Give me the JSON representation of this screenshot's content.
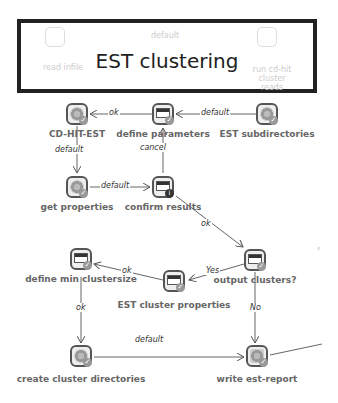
{
  "banner": {
    "title": "EST clustering",
    "ghost_nodes": [
      "read infile",
      "run cd-hit cluster reads"
    ],
    "ghost_edge": "default"
  },
  "nodes": [
    {
      "id": "cdhit",
      "label": "CD-HIT-EST",
      "icon": "gear-icon",
      "x": 66,
      "y": 102
    },
    {
      "id": "defparams",
      "label": "define parameters",
      "icon": "window-icon",
      "x": 152,
      "y": 102
    },
    {
      "id": "estsub",
      "label": "EST subdirectories",
      "icon": "gear-icon",
      "x": 256,
      "y": 102
    },
    {
      "id": "getprops",
      "label": "get properties",
      "icon": "gear-icon",
      "x": 66,
      "y": 175
    },
    {
      "id": "confirm",
      "label": "confirm results",
      "icon": "window-info-icon",
      "x": 152,
      "y": 175
    },
    {
      "id": "outclust",
      "label": "output clusters?",
      "icon": "window-icon",
      "x": 244,
      "y": 248
    },
    {
      "id": "defmin",
      "label": "define min clustersize",
      "icon": "window-icon",
      "x": 70,
      "y": 253
    },
    {
      "id": "estprops",
      "label": "EST cluster properties",
      "icon": "window-icon",
      "x": 163,
      "y": 270
    },
    {
      "id": "createdirs",
      "label": "create cluster directories",
      "icon": "gear-icon",
      "x": 70,
      "y": 345
    },
    {
      "id": "report",
      "label": "write est-report",
      "icon": "report-icon",
      "x": 246,
      "y": 345
    }
  ],
  "edges": {
    "e1": "ok",
    "e2": "default",
    "e3": "default",
    "e4": "default",
    "e5": "cancel",
    "e6": "ok",
    "e7": "Yes",
    "e8": "ok",
    "e9": "ok",
    "e10": "No",
    "e11": "default"
  }
}
